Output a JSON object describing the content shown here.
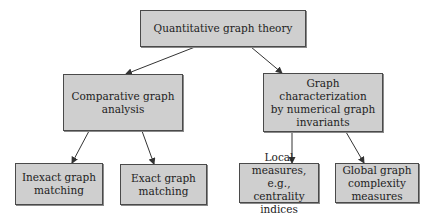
{
  "diagram": {
    "nodes": {
      "root": {
        "label": "Quantitative graph theory"
      },
      "comparative": {
        "label": "Comparative graph\nanalysis"
      },
      "characterization": {
        "label": "Graph characterization\nby numerical graph\ninvariants"
      },
      "inexact": {
        "label": "Inexact graph\nmatching"
      },
      "exact": {
        "label": "Exact graph\nmatching"
      },
      "local": {
        "label": "Local measures,\ne.g., centrality\nindices"
      },
      "global": {
        "label": "Global graph\ncomplexity\nmeasures"
      }
    },
    "edges": [
      {
        "from": "root",
        "to": "comparative"
      },
      {
        "from": "root",
        "to": "characterization"
      },
      {
        "from": "comparative",
        "to": "inexact"
      },
      {
        "from": "comparative",
        "to": "exact"
      },
      {
        "from": "characterization",
        "to": "local"
      },
      {
        "from": "characterization",
        "to": "global"
      }
    ],
    "colors": {
      "box_fill": "#cfcfcf",
      "box_border": "#4a4a4a",
      "arrow": "#333333"
    }
  }
}
